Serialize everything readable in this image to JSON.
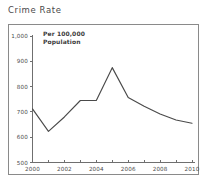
{
  "page_title": "Crime Rate",
  "annotation": {
    "line1": "Per 100,000",
    "line2": "Population"
  },
  "chart_data": {
    "type": "line",
    "title": "Crime Rate",
    "subtitle": "Per 100,000 Population",
    "xlabel": "",
    "ylabel": "Per 100,000 Population",
    "x": [
      2000,
      2001,
      2002,
      2003,
      2004,
      2005,
      2006,
      2007,
      2008,
      2009,
      2010
    ],
    "values": [
      712,
      623,
      680,
      745,
      745,
      875,
      757,
      722,
      692,
      668,
      655
    ],
    "series": [
      {
        "name": "Crime Rate",
        "values": [
          712,
          623,
          680,
          745,
          745,
          875,
          757,
          722,
          692,
          668,
          655
        ]
      }
    ],
    "xlim": [
      2000,
      2010
    ],
    "ylim": [
      500,
      1000
    ],
    "ytick_values": [
      500,
      600,
      700,
      800,
      900,
      1000
    ],
    "ytick_labels": [
      "500",
      "600",
      "700",
      "800",
      "900",
      "1,000"
    ],
    "xtick_values": [
      2000,
      2001,
      2002,
      2003,
      2004,
      2005,
      2006,
      2007,
      2008,
      2009,
      2010
    ],
    "xtick_labels": [
      "2000",
      "",
      "2002",
      "",
      "2004",
      "",
      "2006",
      "",
      "2008",
      "",
      "2010"
    ],
    "xtick_labels_shown": [
      "2000",
      "2002",
      "2004",
      "2006",
      "2008",
      "2010"
    ],
    "grid": false,
    "legend": false,
    "legend_position": "none",
    "line_color": "#4a4a4a",
    "axis_color": "#6f6f6f",
    "frame_color": "#8a8a8a",
    "background_color": "#ffffff"
  }
}
